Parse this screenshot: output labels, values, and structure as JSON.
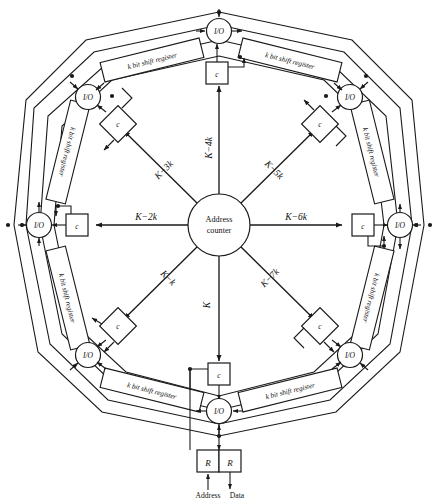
{
  "figure": {
    "hub": {
      "line1": "Address",
      "line2": "counter"
    },
    "io_label": "I/O",
    "control_label": "c",
    "register_label": "R",
    "shift_register_label": "k bit shift register",
    "footer": {
      "address": "Address",
      "data": "Data"
    },
    "spokes": [
      {
        "id": "s0",
        "label": "K",
        "direction": "down",
        "angle_deg": 90
      },
      {
        "id": "s1",
        "label": "K−k",
        "direction": "down-left",
        "angle_deg": 135
      },
      {
        "id": "s2",
        "label": "K−2k",
        "direction": "left",
        "angle_deg": 180
      },
      {
        "id": "s3",
        "label": "K−3k",
        "direction": "up-left",
        "angle_deg": 225
      },
      {
        "id": "s4",
        "label": "K−4k",
        "direction": "up",
        "angle_deg": 270
      },
      {
        "id": "s5",
        "label": "K−5k",
        "direction": "up-right",
        "angle_deg": 315
      },
      {
        "id": "s6",
        "label": "K−6k",
        "direction": "right",
        "angle_deg": 0
      },
      {
        "id": "s7",
        "label": "K−7k",
        "direction": "down-right",
        "angle_deg": 45
      }
    ],
    "io_nodes": [
      {
        "id": "io-bottom",
        "label": "I/O"
      },
      {
        "id": "io-bottom-left",
        "label": "I/O"
      },
      {
        "id": "io-left",
        "label": "I/O"
      },
      {
        "id": "io-top-left",
        "label": "I/O"
      },
      {
        "id": "io-top",
        "label": "I/O"
      },
      {
        "id": "io-top-right",
        "label": "I/O"
      },
      {
        "id": "io-right",
        "label": "I/O"
      },
      {
        "id": "io-bottom-right",
        "label": "I/O"
      }
    ],
    "control_boxes": [
      {
        "id": "c-bottom",
        "shape": "square",
        "label": "c"
      },
      {
        "id": "c-bottom-left",
        "shape": "diamond",
        "label": "c"
      },
      {
        "id": "c-left",
        "shape": "square",
        "label": "c"
      },
      {
        "id": "c-top-left",
        "shape": "diamond",
        "label": "c"
      },
      {
        "id": "c-top",
        "shape": "square",
        "label": "c"
      },
      {
        "id": "c-top-right",
        "shape": "diamond",
        "label": "c"
      },
      {
        "id": "c-right",
        "shape": "square",
        "label": "c"
      },
      {
        "id": "c-bottom-right",
        "shape": "diamond",
        "label": "c"
      }
    ],
    "shift_registers": [
      {
        "id": "sr-top-left",
        "label": "k bit shift register"
      },
      {
        "id": "sr-top-right",
        "label": "k bit shift register"
      },
      {
        "id": "sr-right-upper",
        "label": "k bit shift register"
      },
      {
        "id": "sr-right-lower",
        "label": "k bit shift register"
      },
      {
        "id": "sr-bottom-right",
        "label": "k bit shift register"
      },
      {
        "id": "sr-bottom-left",
        "label": "k bit shift register"
      },
      {
        "id": "sr-left-lower",
        "label": "k bit shift register"
      },
      {
        "id": "sr-left-upper",
        "label": "k bit shift register"
      }
    ],
    "registers": [
      {
        "id": "reg-address",
        "label": "R"
      },
      {
        "id": "reg-data",
        "label": "R"
      }
    ],
    "colors": {
      "ink": "#1a1a1a",
      "paper": "#ffffff"
    }
  }
}
